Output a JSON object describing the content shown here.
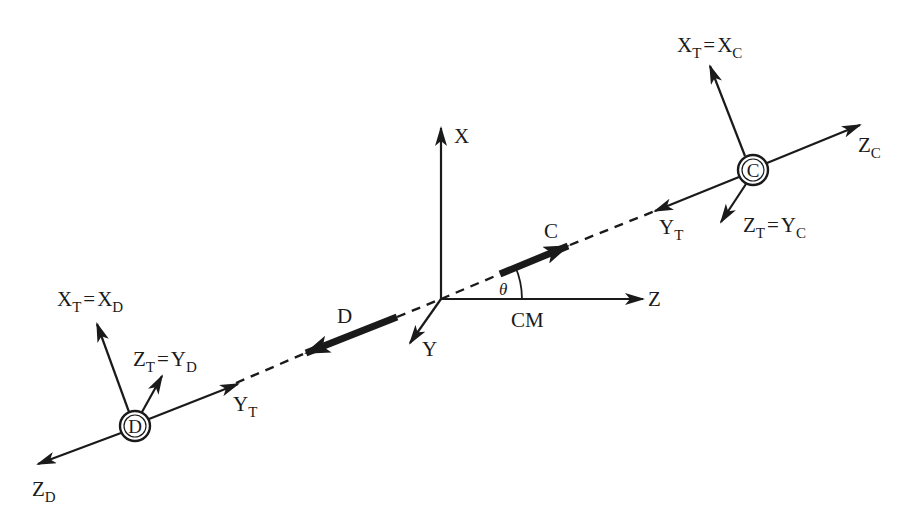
{
  "diagram": {
    "central_frame": {
      "x_label": "X",
      "y_label": "Y",
      "z_label": "Z",
      "origin_label": "CM",
      "angle_label": "θ"
    },
    "force_arrows": {
      "c_label": "C",
      "d_label": "D"
    },
    "body_c": {
      "letter": "C",
      "x_axis": {
        "main": "X",
        "sub1": "T",
        "eq": "=",
        "main2": "X",
        "sub2": "C"
      },
      "z_axis": {
        "main": "Z",
        "sub": "C"
      },
      "y_axis": {
        "main": "Y",
        "sub": "T"
      },
      "zt_axis": {
        "main": "Z",
        "sub1": "T",
        "eq": "=",
        "main2": "Y",
        "sub2": "C"
      }
    },
    "body_d": {
      "letter": "D",
      "x_axis": {
        "main": "X",
        "sub1": "T",
        "eq": "=",
        "main2": "X",
        "sub2": "D"
      },
      "zt_axis": {
        "main": "Z",
        "sub1": "T",
        "eq": "=",
        "main2": "Y",
        "sub2": "D"
      },
      "y_axis": {
        "main": "Y",
        "sub": "T"
      },
      "z_axis": {
        "main": "Z",
        "sub": "D"
      }
    },
    "colors": {
      "ink": "#1a1a1a",
      "background": "#ffffff"
    }
  }
}
